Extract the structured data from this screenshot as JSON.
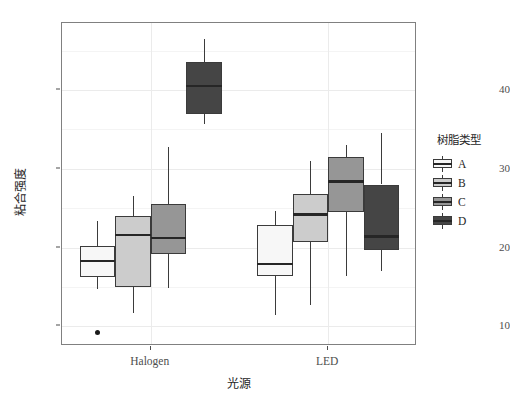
{
  "chart_data": {
    "type": "box",
    "title": "",
    "xlabel": "光源",
    "ylabel": "粘合强度",
    "ylim": [
      7.5,
      48.5
    ],
    "yticks": [
      10,
      20,
      30,
      40
    ],
    "ytick_labels": [
      "10",
      "20",
      "30",
      "40"
    ],
    "categories": [
      "Halogen",
      "LED"
    ],
    "grid": true,
    "legend": {
      "title": "树脂类型",
      "position": "right",
      "entries": [
        "A",
        "B",
        "C",
        "D"
      ]
    },
    "colors": {
      "A": "#f7f7f7",
      "B": "#cccccc",
      "C": "#969696",
      "D": "#454545",
      "outline": "#3b3b3b",
      "median": "#262626",
      "panel_background": "#ffffff",
      "panel_border": "#808080",
      "gridline": "#ebebeb"
    },
    "series": [
      {
        "name": "A",
        "color": "#f7f7f7",
        "boxes": [
          {
            "category": "Halogen",
            "lower_whisker": 14.7,
            "q1": 16.3,
            "median": 18.3,
            "q3": 20.2,
            "upper_whisker": 23.4,
            "outliers": [
              9.2
            ]
          },
          {
            "category": "LED",
            "lower_whisker": 11.4,
            "q1": 16.4,
            "median": 17.9,
            "q3": 22.9,
            "upper_whisker": 24.6,
            "outliers": []
          }
        ]
      },
      {
        "name": "B",
        "color": "#cccccc",
        "boxes": [
          {
            "category": "Halogen",
            "lower_whisker": 11.7,
            "q1": 15.0,
            "median": 21.6,
            "q3": 24.0,
            "upper_whisker": 26.5,
            "outliers": []
          },
          {
            "category": "LED",
            "lower_whisker": 12.7,
            "q1": 20.7,
            "median": 24.2,
            "q3": 26.8,
            "upper_whisker": 31.0,
            "outliers": []
          }
        ]
      },
      {
        "name": "C",
        "color": "#969696",
        "boxes": [
          {
            "category": "Halogen",
            "lower_whisker": 14.8,
            "q1": 19.2,
            "median": 21.2,
            "q3": 25.5,
            "upper_whisker": 32.8,
            "outliers": []
          },
          {
            "category": "LED",
            "lower_whisker": 16.4,
            "q1": 24.5,
            "median": 28.4,
            "q3": 31.5,
            "upper_whisker": 33.0,
            "outliers": []
          }
        ]
      },
      {
        "name": "D",
        "color": "#454545",
        "boxes": [
          {
            "category": "Halogen",
            "lower_whisker": 35.7,
            "q1": 37.0,
            "median": 40.5,
            "q3": 43.5,
            "upper_whisker": 46.5,
            "outliers": []
          },
          {
            "category": "LED",
            "lower_whisker": 17.0,
            "q1": 19.7,
            "median": 21.4,
            "q3": 28.0,
            "upper_whisker": 34.5,
            "outliers": []
          }
        ]
      }
    ]
  }
}
